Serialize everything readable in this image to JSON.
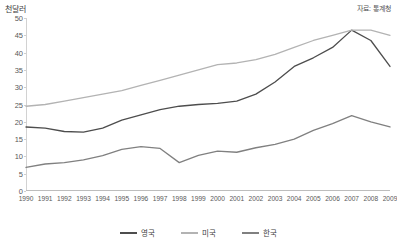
{
  "unit_label": "천달러",
  "source_label": "자료: 통계청",
  "legend": {
    "items": [
      {
        "label": "영국",
        "color": "#4d4d4d"
      },
      {
        "label": "미국",
        "color": "#b3b3b3"
      },
      {
        "label": "한국",
        "color": "#808080"
      }
    ]
  },
  "chart_data": {
    "type": "line",
    "title": "",
    "subtitle": "",
    "xlabel": "",
    "ylabel": "천달러",
    "unit": "천달러",
    "source": "자료: 통계청",
    "grid": false,
    "legend_position": "bottom",
    "xlim": [
      1990,
      2009
    ],
    "ylim": [
      0,
      50
    ],
    "ytick_step": 5,
    "categories": [
      "1990",
      "1991",
      "1992",
      "1993",
      "1994",
      "1995",
      "1996",
      "1997",
      "1998",
      "1999",
      "2000",
      "2001",
      "2002",
      "2003",
      "2004",
      "2005",
      "2006",
      "2007",
      "2008",
      "2009"
    ],
    "yticks": [
      0,
      5,
      10,
      15,
      20,
      25,
      30,
      35,
      40,
      45,
      50
    ],
    "series": [
      {
        "name": "영국",
        "color": "#4d4d4d",
        "values": [
          18.5,
          18.2,
          17.2,
          17.0,
          18.2,
          20.5,
          22.0,
          23.5,
          24.5,
          25.0,
          25.3,
          26.0,
          28.0,
          31.5,
          36.0,
          38.5,
          41.5,
          46.5,
          43.5,
          36.0
        ]
      },
      {
        "name": "미국",
        "color": "#b3b3b3",
        "values": [
          24.5,
          25.0,
          26.0,
          27.0,
          28.0,
          29.0,
          30.5,
          32.0,
          33.5,
          35.0,
          36.5,
          37.0,
          38.0,
          39.5,
          41.5,
          43.5,
          45.0,
          46.5,
          46.5,
          45.0
        ]
      },
      {
        "name": "한국",
        "color": "#808080",
        "values": [
          6.8,
          7.8,
          8.2,
          9.0,
          10.2,
          12.0,
          12.8,
          12.3,
          8.2,
          10.3,
          11.5,
          11.2,
          12.5,
          13.5,
          15.0,
          17.5,
          19.5,
          21.8,
          20.0,
          18.5
        ]
      }
    ]
  }
}
